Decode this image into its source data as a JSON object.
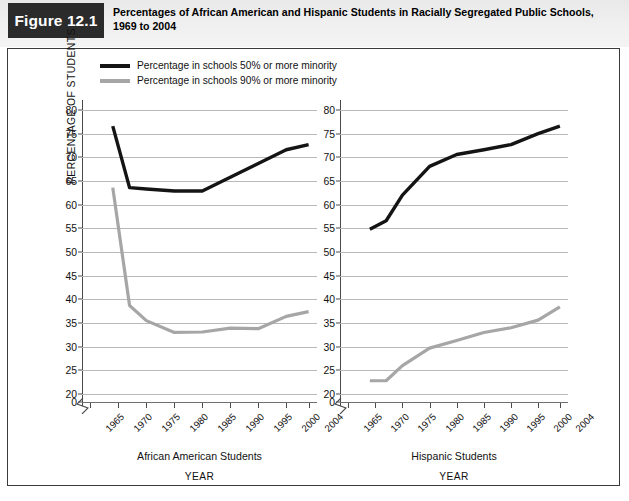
{
  "header": {
    "figure_badge": "Figure 12.1",
    "title": "Percentages of African American and Hispanic Students in Racially Segregated Public Schools, 1969 to 2004"
  },
  "legend": {
    "items": [
      {
        "label": "Percentage in schools 50% or more minority",
        "color": "#141414",
        "style": "dark"
      },
      {
        "label": "Percentage in schools 90% or more minority",
        "color": "#a6a6a6",
        "style": "light"
      }
    ]
  },
  "axes": {
    "y_axis_title": "PERCENTAGE OF STUDENTS",
    "y_ticks": [
      "0",
      "20",
      "25",
      "30",
      "35",
      "40",
      "45",
      "50",
      "55",
      "60",
      "65",
      "70",
      "75",
      "80"
    ],
    "y_break_after": "0",
    "x_ticks": [
      "1965",
      "1970",
      "1975",
      "1980",
      "1985",
      "1990",
      "1995",
      "2000",
      "2004"
    ],
    "x_axis_title": "YEAR"
  },
  "chart_data": [
    {
      "type": "line",
      "title": "African American Students",
      "panel": "left",
      "xlabel": "YEAR",
      "ylabel": "PERCENTAGE OF STUDENTS",
      "x": [
        1969,
        1972,
        1975,
        1980,
        1985,
        1990,
        1995,
        2000,
        2004
      ],
      "xlim": [
        1963.5,
        2005.5
      ],
      "ylim": [
        20,
        80
      ],
      "y_break": true,
      "grid": true,
      "legend_position": "above-plot",
      "series": [
        {
          "name": "Percentage in schools 50% or more minority",
          "color": "#141414",
          "values": [
            76.6,
            63.6,
            63.3,
            62.9,
            62.9,
            65.8,
            68.7,
            71.6,
            72.7
          ]
        },
        {
          "name": "Percentage in schools 90% or more minority",
          "color": "#a6a6a6",
          "values": [
            63.6,
            38.7,
            35.5,
            33.0,
            33.1,
            33.9,
            33.8,
            36.4,
            37.4
          ]
        }
      ]
    },
    {
      "type": "line",
      "title": "Hispanic Students",
      "panel": "right",
      "xlabel": "YEAR",
      "ylabel": "PERCENTAGE OF STUDENTS",
      "x": [
        1969,
        1972,
        1975,
        1980,
        1985,
        1990,
        1995,
        2000,
        2004
      ],
      "xlim": [
        1963.5,
        2005.5
      ],
      "ylim": [
        20,
        80
      ],
      "y_break": true,
      "grid": true,
      "legend_position": "above-plot",
      "series": [
        {
          "name": "Percentage in schools 50% or more minority",
          "color": "#141414",
          "values": [
            54.8,
            56.6,
            62.0,
            68.1,
            70.6,
            71.6,
            72.7,
            75.0,
            76.6
          ]
        },
        {
          "name": "Percentage in schools 90% or more minority",
          "color": "#a6a6a6",
          "values": [
            22.8,
            22.8,
            26.0,
            29.7,
            31.3,
            33.0,
            34.0,
            35.6,
            38.4
          ]
        }
      ]
    }
  ],
  "panels": [
    {
      "caption": "African American Students",
      "year_label": "YEAR"
    },
    {
      "caption": "Hispanic Students",
      "year_label": "YEAR"
    }
  ]
}
